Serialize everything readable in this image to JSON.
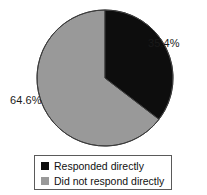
{
  "chart_data": {
    "type": "pie",
    "title": "",
    "categories": [
      "Responded directly",
      "Did not respond directly"
    ],
    "values": [
      35.4,
      64.6
    ],
    "value_labels": [
      "35.4%",
      "64.6%"
    ],
    "colors": [
      "#0d0d0d",
      "#999999"
    ],
    "units": "percent",
    "start_angle_deg": 0,
    "direction": "clockwise",
    "legend": {
      "position": "bottom",
      "bordered": true,
      "entries": [
        {
          "label": "Responded directly",
          "color": "#0d0d0d",
          "swatch": "filled-square"
        },
        {
          "label": "Did not respond directly",
          "color": "#999999",
          "swatch": "filled-square"
        }
      ]
    },
    "annotations": [
      {
        "text": "35.4%",
        "for": "Responded directly",
        "placement": "outside-upper-right"
      },
      {
        "text": "64.6%",
        "for": "Did not respond directly",
        "placement": "outside-left"
      }
    ],
    "grid": false,
    "xlabel": "",
    "ylabel": ""
  },
  "figure": {
    "background": "#ffffff",
    "outline_color": "#3c3c3c"
  }
}
